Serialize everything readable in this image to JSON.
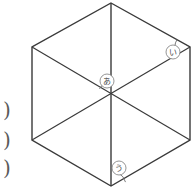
{
  "figure": {
    "stroke_color": "#3a3a3a",
    "label_color": "#4a4a4a",
    "background_color": "#ffffff",
    "hexagon": {
      "center": {
        "x": 111,
        "y": 95
      },
      "vertices": [
        {
          "name": "top",
          "x": 111,
          "y": 3
        },
        {
          "name": "upper-right",
          "x": 190,
          "y": 47
        },
        {
          "name": "lower-right",
          "x": 190,
          "y": 140
        },
        {
          "name": "bottom",
          "x": 111,
          "y": 186
        },
        {
          "name": "lower-left",
          "x": 32,
          "y": 140
        },
        {
          "name": "upper-left",
          "x": 32,
          "y": 47
        }
      ]
    },
    "labels": [
      {
        "id": "a",
        "text": "あ",
        "x": 107,
        "y": 81,
        "radius": 7
      },
      {
        "id": "i",
        "text": "い",
        "x": 173,
        "y": 52,
        "radius": 7
      },
      {
        "id": "u",
        "text": "う",
        "x": 119,
        "y": 168,
        "radius": 7
      }
    ],
    "angle_arcs": [
      {
        "id": "arc-a",
        "cx": 111,
        "cy": 95,
        "r": 13,
        "start_deg": 208,
        "end_deg": 270
      },
      {
        "id": "arc-i",
        "cx": 190,
        "cy": 47,
        "r": 15,
        "start_deg": 150,
        "end_deg": 212
      },
      {
        "id": "arc-u",
        "cx": 111,
        "cy": 186,
        "r": 15,
        "start_deg": 300,
        "end_deg": 345
      }
    ],
    "edge_marks": [
      {
        "id": "paren-1",
        "text": ")",
        "x": 7,
        "y": 110
      },
      {
        "id": "paren-2",
        "text": ")",
        "x": 7,
        "y": 140
      },
      {
        "id": "paren-3",
        "text": ")",
        "x": 7,
        "y": 168
      }
    ]
  }
}
